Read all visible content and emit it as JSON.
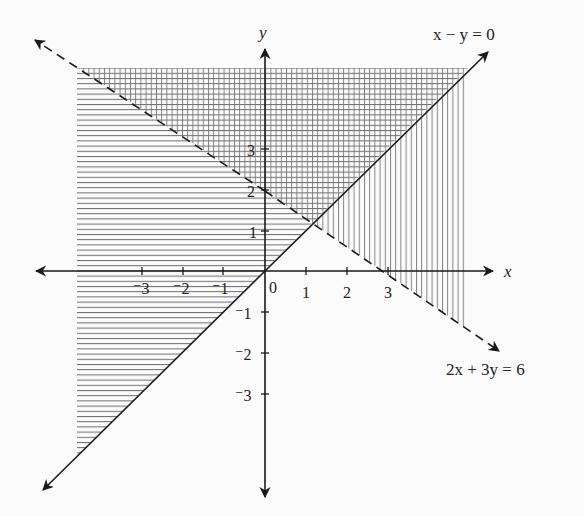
{
  "figure": {
    "x_axis_label": "x",
    "y_axis_label": "y",
    "origin_label": "0",
    "x_ticks": [
      {
        "value": -3,
        "label": "⁻3"
      },
      {
        "value": -2,
        "label": "⁻2"
      },
      {
        "value": -1,
        "label": "⁻1"
      },
      {
        "value": 1,
        "label": "1"
      },
      {
        "value": 2,
        "label": "2"
      },
      {
        "value": 3,
        "label": "3"
      }
    ],
    "y_ticks": [
      {
        "value": 3,
        "label": "3"
      },
      {
        "value": 2,
        "label": "2"
      },
      {
        "value": 1,
        "label": "1"
      },
      {
        "value": -1,
        "label": "⁻1"
      },
      {
        "value": -2,
        "label": "⁻2"
      },
      {
        "value": -3,
        "label": "⁻3"
      }
    ],
    "lines": [
      {
        "equation": "x − y = 0",
        "style": "solid",
        "boundary_included": true
      },
      {
        "equation": "2x + 3y = 6",
        "style": "dashed",
        "boundary_included": false
      }
    ],
    "shaded_regions": [
      {
        "description": "y ≥ x (horizontal hatching)",
        "pattern": "horizontal"
      },
      {
        "description": "2x + 3y > 6 (vertical hatching)",
        "pattern": "vertical"
      },
      {
        "description": "Intersection of both (cross-hatched)",
        "pattern": "cross"
      }
    ],
    "colors": {
      "ink": "#1a1a1a",
      "hatch": "#6a6a6a",
      "background": "#fbfbfb"
    }
  }
}
